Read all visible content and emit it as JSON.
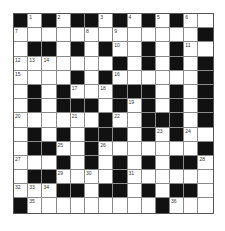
{
  "puzzle": {
    "rows": 14,
    "cols": 14,
    "colors": {
      "block": "#111111",
      "cell": "#ffffff",
      "line": "#8a8a8a"
    },
    "grid": [
      [
        "#",
        "1",
        "#",
        "2",
        "#",
        "#",
        "3",
        "#",
        "4",
        "#",
        "5",
        "#",
        "6",
        "."
      ],
      [
        "7",
        ".",
        ".",
        ".",
        ".",
        "8",
        ".",
        "9",
        ".",
        ".",
        ".",
        ".",
        ".",
        "#"
      ],
      [
        ".",
        "#",
        "#",
        ".",
        "#",
        ".",
        "#",
        "10",
        ".",
        "#",
        ".",
        "#",
        "11",
        "."
      ],
      [
        "12",
        "13",
        "14",
        ".",
        ".",
        ".",
        ".",
        "#",
        ".",
        "#",
        ".",
        "#",
        ".",
        "#"
      ],
      [
        "15",
        ".",
        ".",
        ".",
        "#",
        ".",
        "#",
        "16",
        ".",
        ".",
        ".",
        ".",
        ".",
        "#"
      ],
      [
        ".",
        "#",
        ".",
        "#",
        "17",
        ".",
        "18",
        "#",
        "#",
        "#",
        ".",
        "#",
        ".",
        "#"
      ],
      [
        ".",
        "#",
        ".",
        "#",
        "#",
        "#",
        ".",
        "#",
        "19",
        "#",
        ".",
        "#",
        ".",
        "#"
      ],
      [
        "20",
        ".",
        ".",
        ".",
        "21",
        ".",
        "#",
        "22",
        ".",
        "#",
        "#",
        "#",
        ".",
        "#"
      ],
      [
        ".",
        "#",
        ".",
        "#",
        ".",
        "#",
        "#",
        "#",
        ".",
        "#",
        "23",
        "#",
        "24",
        "."
      ],
      [
        ".",
        "#",
        "#",
        "25",
        ".",
        "#",
        "26",
        ".",
        ".",
        ".",
        ".",
        ".",
        ".",
        "#"
      ],
      [
        "27",
        ".",
        ".",
        "#",
        ".",
        "#",
        ".",
        "#",
        ".",
        "#",
        ".",
        "#",
        "#",
        "28"
      ],
      [
        ".",
        "#",
        "#",
        "29",
        ".",
        "30",
        ".",
        "#",
        "31",
        ".",
        ".",
        ".",
        ".",
        "."
      ],
      [
        "32",
        "33",
        "34",
        "#",
        "#",
        ".",
        "#",
        "#",
        ".",
        "#",
        ".",
        "#",
        "#",
        "."
      ],
      [
        "#",
        "35",
        ".",
        ".",
        ".",
        ".",
        ".",
        ".",
        ".",
        ".",
        "#",
        "36",
        ".",
        "."
      ]
    ]
  }
}
